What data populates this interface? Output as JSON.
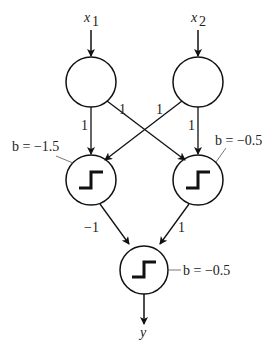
{
  "diagram": {
    "type": "neural-network",
    "inputs": [
      {
        "id": "x1",
        "label": "x",
        "subscript": "1"
      },
      {
        "id": "x2",
        "label": "x",
        "subscript": "2"
      }
    ],
    "hidden": [
      {
        "id": "h1",
        "bias_label": "b = −1.5",
        "activation": "step"
      },
      {
        "id": "h2",
        "bias_label": "b = −0.5",
        "activation": "step"
      }
    ],
    "output": {
      "id": "o",
      "bias_label": "b = −0.5",
      "activation": "step",
      "output_label": "y"
    },
    "weights": {
      "x1_h1": "1",
      "x1_h2": "1",
      "x2_h1": "1",
      "x2_h2": "1",
      "h1_o": "−1",
      "h2_o": "1"
    },
    "colors": {
      "stroke": "#111111",
      "text": "#222222",
      "background": "#ffffff"
    }
  }
}
